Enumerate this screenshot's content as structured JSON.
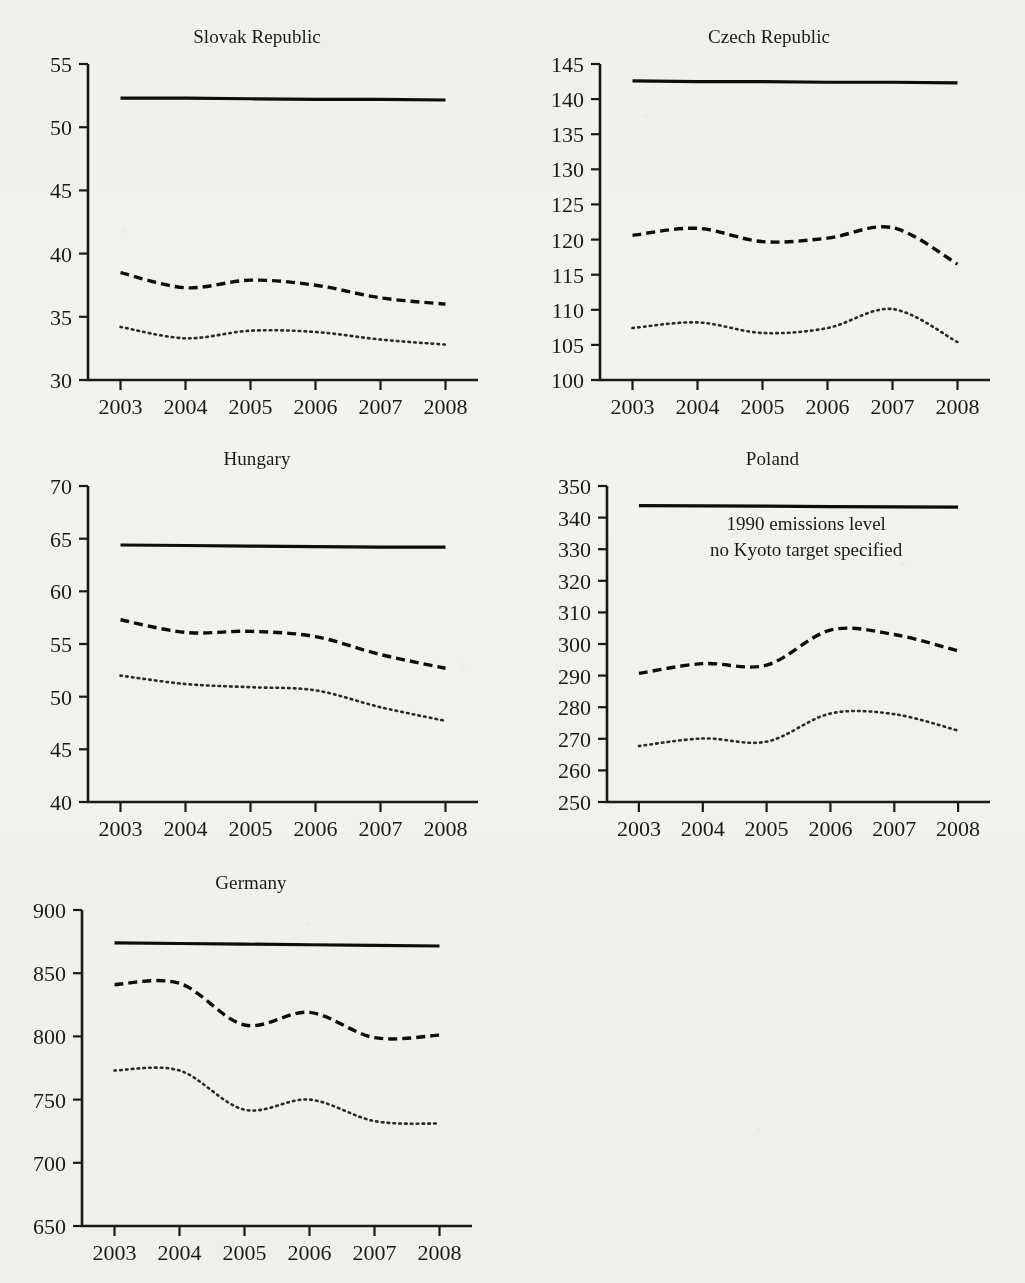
{
  "figure": {
    "background_color": "#f3f2ee",
    "ink_color": "#1a1a1a",
    "xtick_labels": [
      "2003",
      "2004",
      "2005",
      "2006",
      "2007",
      "2008"
    ]
  },
  "chart_data": [
    {
      "type": "line",
      "title": "Slovak Republic",
      "xlabel": "",
      "ylabel": "",
      "x": [
        2003,
        2004,
        2005,
        2006,
        2007,
        2008
      ],
      "xlim": [
        2002.5,
        2008.5
      ],
      "ylim": [
        30,
        55
      ],
      "yticks": [
        30,
        35,
        40,
        45,
        50,
        55
      ],
      "ytick_labels": [
        "30",
        "35",
        "40",
        "45",
        "50",
        "55"
      ],
      "grid": false,
      "legend": "none",
      "series": [
        {
          "name": "1990 emissions level",
          "style": "solid",
          "values": [
            52.3,
            52.3,
            52.25,
            52.2,
            52.2,
            52.15
          ]
        },
        {
          "name": "emissions with LULUCF excluded",
          "style": "dashed",
          "values": [
            38.5,
            37.3,
            37.9,
            37.5,
            36.5,
            36.0
          ]
        },
        {
          "name": "emissions with LULUCF included",
          "style": "dotted",
          "values": [
            34.2,
            33.3,
            33.9,
            33.8,
            33.2,
            32.8
          ]
        }
      ]
    },
    {
      "type": "line",
      "title": "Czech Republic",
      "xlabel": "",
      "ylabel": "",
      "x": [
        2003,
        2004,
        2005,
        2006,
        2007,
        2008
      ],
      "xlim": [
        2002.5,
        2008.5
      ],
      "ylim": [
        100,
        145
      ],
      "yticks": [
        100,
        105,
        110,
        115,
        120,
        125,
        130,
        135,
        140,
        145
      ],
      "ytick_labels": [
        "100",
        "105",
        "110",
        "115",
        "120",
        "125",
        "130",
        "135",
        "140",
        "145"
      ],
      "grid": false,
      "legend": "none",
      "series": [
        {
          "name": "1990 emissions level",
          "style": "solid",
          "values": [
            142.6,
            142.5,
            142.5,
            142.4,
            142.4,
            142.3
          ]
        },
        {
          "name": "emissions with LULUCF excluded",
          "style": "dashed",
          "values": [
            120.6,
            121.6,
            119.7,
            120.2,
            121.7,
            116.5
          ]
        },
        {
          "name": "emissions with LULUCF included",
          "style": "dotted",
          "values": [
            107.4,
            108.2,
            106.7,
            107.4,
            110.1,
            105.4
          ]
        }
      ]
    },
    {
      "type": "line",
      "title": "Hungary",
      "xlabel": "",
      "ylabel": "",
      "x": [
        2003,
        2004,
        2005,
        2006,
        2007,
        2008
      ],
      "xlim": [
        2002.5,
        2008.5
      ],
      "ylim": [
        40,
        70
      ],
      "yticks": [
        40,
        45,
        50,
        55,
        60,
        65,
        70
      ],
      "ytick_labels": [
        "40",
        "45",
        "50",
        "55",
        "60",
        "65",
        "70"
      ],
      "grid": false,
      "legend": "none",
      "series": [
        {
          "name": "1990 emissions level",
          "style": "solid",
          "values": [
            64.4,
            64.35,
            64.3,
            64.25,
            64.2,
            64.2
          ]
        },
        {
          "name": "emissions with LULUCF excluded",
          "style": "dashed",
          "values": [
            57.3,
            56.1,
            56.2,
            55.7,
            54.0,
            52.7
          ]
        },
        {
          "name": "emissions with LULUCF included",
          "style": "dotted",
          "values": [
            52.0,
            51.2,
            50.9,
            50.6,
            49.0,
            47.7
          ]
        }
      ]
    },
    {
      "type": "line",
      "title": "Poland",
      "xlabel": "",
      "ylabel": "",
      "x": [
        2003,
        2004,
        2005,
        2006,
        2007,
        2008
      ],
      "xlim": [
        2002.5,
        2008.5
      ],
      "ylim": [
        250,
        350
      ],
      "yticks": [
        250,
        260,
        270,
        280,
        290,
        300,
        310,
        320,
        330,
        340,
        350
      ],
      "ytick_labels": [
        "250",
        "260",
        "270",
        "280",
        "290",
        "300",
        "310",
        "320",
        "330",
        "340",
        "350"
      ],
      "grid": false,
      "legend": "none",
      "annotations": [
        "1990 emissions level",
        "no Kyoto target specified"
      ],
      "series": [
        {
          "name": "1990 emissions level",
          "style": "solid",
          "values": [
            343.8,
            343.7,
            343.6,
            343.5,
            343.4,
            343.3
          ]
        },
        {
          "name": "emissions with LULUCF excluded",
          "style": "dashed",
          "values": [
            290.7,
            293.8,
            293.3,
            304.4,
            303.0,
            297.8
          ]
        },
        {
          "name": "emissions with LULUCF included",
          "style": "dotted",
          "values": [
            267.7,
            270.1,
            269.1,
            278.0,
            277.8,
            272.6
          ]
        }
      ]
    },
    {
      "type": "line",
      "title": "Germany",
      "xlabel": "",
      "ylabel": "",
      "x": [
        2003,
        2004,
        2005,
        2006,
        2007,
        2008
      ],
      "xlim": [
        2002.5,
        2008.5
      ],
      "ylim": [
        650,
        900
      ],
      "yticks": [
        650,
        700,
        750,
        800,
        850,
        900
      ],
      "ytick_labels": [
        "650",
        "700",
        "750",
        "800",
        "850",
        "900"
      ],
      "grid": false,
      "legend": "none",
      "series": [
        {
          "name": "1990 emissions level",
          "style": "solid",
          "values": [
            874,
            873.5,
            873,
            872.5,
            872,
            871.5
          ]
        },
        {
          "name": "emissions with LULUCF excluded",
          "style": "dashed",
          "values": [
            841,
            842,
            809,
            819,
            799,
            801
          ]
        },
        {
          "name": "emissions with LULUCF included",
          "style": "dotted",
          "values": [
            773,
            773,
            742,
            750,
            733,
            731
          ]
        }
      ]
    }
  ]
}
